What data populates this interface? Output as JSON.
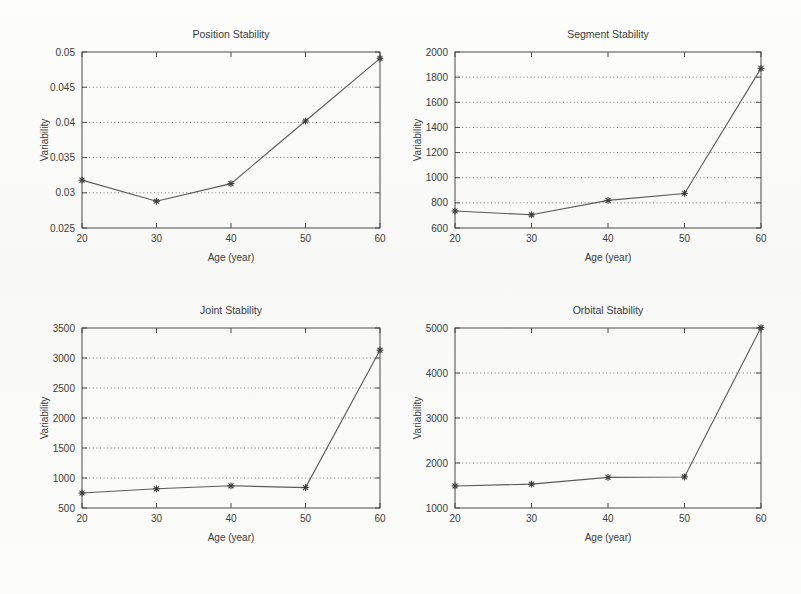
{
  "figure": {
    "background_color": "#fbfbf9",
    "line_color": "#5a5a5a",
    "axis_color": "#4a4a4a",
    "text_color": "#3a3a3a",
    "marker": "star"
  },
  "chart_data": [
    {
      "type": "line",
      "panel": "top-left",
      "title": "Position Stability",
      "xlabel": "Age (year)",
      "ylabel": "Variability",
      "x": [
        20,
        30,
        40,
        50,
        60
      ],
      "values": [
        0.0318,
        0.0288,
        0.0313,
        0.0402,
        0.0491
      ],
      "xticks": [
        20,
        30,
        40,
        50,
        60
      ],
      "xtick_labels": [
        "20",
        "30",
        "40",
        "50",
        "60"
      ],
      "yticks": [
        0.025,
        0.03,
        0.035,
        0.04,
        0.045,
        0.05
      ],
      "ytick_labels": [
        "0.025",
        "0.03",
        "0.035",
        "0.04",
        "0.045",
        "0.05"
      ],
      "xlim": [
        20,
        60
      ],
      "ylim": [
        0.025,
        0.05
      ],
      "grid": true,
      "legend": "none"
    },
    {
      "type": "line",
      "panel": "top-right",
      "title": "Segment Stability",
      "xlabel": "Age (year)",
      "ylabel": "Variability",
      "x": [
        20,
        30,
        40,
        50,
        60
      ],
      "values": [
        735,
        705,
        820,
        875,
        1870
      ],
      "xticks": [
        20,
        30,
        40,
        50,
        60
      ],
      "xtick_labels": [
        "20",
        "30",
        "40",
        "50",
        "60"
      ],
      "yticks": [
        600,
        800,
        1000,
        1200,
        1400,
        1600,
        1800,
        2000
      ],
      "ytick_labels": [
        "600",
        "800",
        "1000",
        "1200",
        "1400",
        "1600",
        "1800",
        "2000"
      ],
      "xlim": [
        20,
        60
      ],
      "ylim": [
        600,
        2000
      ],
      "grid": true,
      "legend": "none"
    },
    {
      "type": "line",
      "panel": "bottom-left",
      "title": "Joint Stability",
      "xlabel": "Age (year)",
      "ylabel": "Variability",
      "x": [
        20,
        30,
        40,
        50,
        60
      ],
      "values": [
        750,
        820,
        870,
        840,
        3130
      ],
      "xticks": [
        20,
        30,
        40,
        50,
        60
      ],
      "xtick_labels": [
        "20",
        "30",
        "40",
        "50",
        "60"
      ],
      "yticks": [
        500,
        1000,
        1500,
        2000,
        2500,
        3000,
        3500
      ],
      "ytick_labels": [
        "500",
        "1000",
        "1500",
        "2000",
        "2500",
        "3000",
        "3500"
      ],
      "xlim": [
        20,
        60
      ],
      "ylim": [
        500,
        3500
      ],
      "grid": true,
      "legend": "none"
    },
    {
      "type": "line",
      "panel": "bottom-right",
      "title": "Orbital Stability",
      "xlabel": "Age (year)",
      "ylabel": "Variability",
      "x": [
        20,
        30,
        40,
        50,
        60
      ],
      "values": [
        1490,
        1530,
        1680,
        1690,
        5010
      ],
      "xticks": [
        20,
        30,
        40,
        50,
        60
      ],
      "xtick_labels": [
        "20",
        "30",
        "40",
        "50",
        "60"
      ],
      "yticks": [
        1000,
        2000,
        3000,
        4000,
        5000
      ],
      "ytick_labels": [
        "1000",
        "2000",
        "3000",
        "4000",
        "5000"
      ],
      "xlim": [
        1000,
        5000
      ],
      "ylim": [
        1000,
        5000
      ],
      "grid": true,
      "legend": "none"
    }
  ]
}
